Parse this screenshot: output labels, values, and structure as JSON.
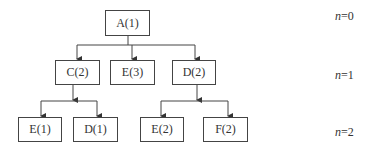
{
  "diagram": {
    "type": "tree",
    "nodes": {
      "root": {
        "label": "A(1)"
      },
      "c2": {
        "label": "C(2)"
      },
      "e3": {
        "label": "E(3)"
      },
      "d2": {
        "label": "D(2)"
      },
      "e1": {
        "label": "E(1)"
      },
      "d1": {
        "label": "D(1)"
      },
      "e2": {
        "label": "E(2)"
      },
      "f2": {
        "label": "F(2)"
      }
    },
    "edges": [
      [
        "A(1)",
        "C(2)"
      ],
      [
        "A(1)",
        "E(3)"
      ],
      [
        "A(1)",
        "D(2)"
      ],
      [
        "C(2)",
        "E(1)"
      ],
      [
        "C(2)",
        "D(1)"
      ],
      [
        "D(2)",
        "E(2)"
      ],
      [
        "D(2)",
        "F(2)"
      ]
    ],
    "levels": [
      {
        "var": "n",
        "value": "=0"
      },
      {
        "var": "n",
        "value": "=1"
      },
      {
        "var": "n",
        "value": "=2"
      }
    ]
  }
}
